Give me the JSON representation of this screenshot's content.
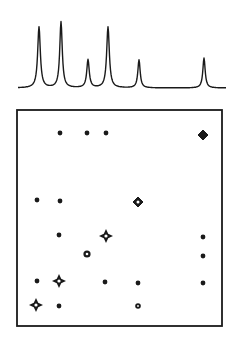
{
  "figure": {
    "type": "2D NMR correlation spectrum (COSY-style) with 1D projection",
    "colors": {
      "ink": "#1a1a1a",
      "background": "#ffffff"
    },
    "spectrum_1d": {
      "baseline_y": 88,
      "x_start": 18,
      "x_end": 226,
      "peaks": [
        {
          "x": 39,
          "top": 27,
          "width": 3.2
        },
        {
          "x": 61,
          "top": 22,
          "width": 3.0
        },
        {
          "x": 88,
          "top": 60,
          "width": 3.0
        },
        {
          "x": 108,
          "top": 27,
          "width": 3.2
        },
        {
          "x": 139,
          "top": 60,
          "width": 2.8
        },
        {
          "x": 204,
          "top": 58,
          "width": 2.8
        }
      ]
    },
    "map_2d": {
      "frame": {
        "x": 17,
        "y": 110,
        "width": 205,
        "height": 216
      },
      "diagonal_peaks": [
        {
          "x": 36,
          "y": 305,
          "shape": "star"
        },
        {
          "x": 59,
          "y": 281,
          "shape": "star"
        },
        {
          "x": 87,
          "y": 254,
          "shape": "ring"
        },
        {
          "x": 106,
          "y": 236,
          "shape": "star"
        },
        {
          "x": 138,
          "y": 202,
          "shape": "diamond"
        },
        {
          "x": 203,
          "y": 135,
          "shape": "diamond-solid"
        }
      ],
      "cross_peaks": [
        {
          "x": 60,
          "y": 133
        },
        {
          "x": 87,
          "y": 133
        },
        {
          "x": 106,
          "y": 133
        },
        {
          "x": 37,
          "y": 200
        },
        {
          "x": 60,
          "y": 201
        },
        {
          "x": 59,
          "y": 235
        },
        {
          "x": 203,
          "y": 237
        },
        {
          "x": 203,
          "y": 256
        },
        {
          "x": 37,
          "y": 281
        },
        {
          "x": 105,
          "y": 282
        },
        {
          "x": 138,
          "y": 283
        },
        {
          "x": 203,
          "y": 283
        },
        {
          "x": 59,
          "y": 306
        },
        {
          "x": 138,
          "y": 306,
          "ring": true
        }
      ]
    }
  }
}
